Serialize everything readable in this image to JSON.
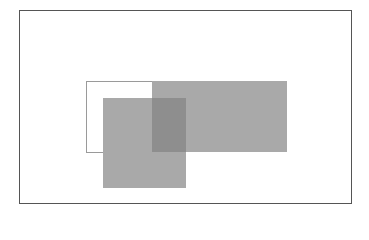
{
  "diagram": {
    "canvas": {
      "width": 369,
      "height": 214,
      "background": "#ffffff"
    },
    "frame": {
      "x": 19,
      "y": 10,
      "width": 333,
      "height": 194,
      "border_color": "#555555"
    },
    "shapes": [
      {
        "id": "outlined-rectangle",
        "x": 86,
        "y": 81,
        "width": 67,
        "height": 72,
        "fill": "#ffffff",
        "stroke": "#9a9a9a"
      },
      {
        "id": "wide-gray-rectangle",
        "x": 152,
        "y": 81,
        "width": 135,
        "height": 71,
        "fill": "#a9a9a9"
      },
      {
        "id": "lower-gray-square",
        "x": 103,
        "y": 98,
        "width": 83,
        "height": 90,
        "fill": "#a9a9a9"
      },
      {
        "id": "overlap-region",
        "x": 152,
        "y": 98,
        "width": 34,
        "height": 54,
        "fill": "#8e8e8e"
      }
    ]
  }
}
